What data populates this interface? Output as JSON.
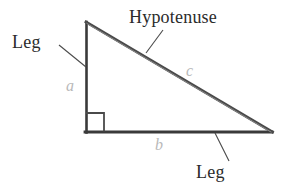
{
  "figure": {
    "background_color": "#ffffff",
    "stroke_color": "#3a3a3a",
    "leader_color": "#4a4a4a",
    "side_label_color": "#b9b9b9",
    "text_color": "#2b2b2b"
  },
  "labels": {
    "leg_top": "Leg",
    "hypotenuse": "Hypotenuse",
    "leg_bottom": "Leg",
    "side_a": "a",
    "side_b": "b",
    "side_c": "c"
  },
  "geometry": {
    "apex": [
      86,
      22
    ],
    "right_angle_vertex": [
      86,
      132
    ],
    "far_vertex": [
      272,
      132
    ],
    "right_angle_marker": {
      "x": 86,
      "y": 113,
      "size": 18
    }
  },
  "leaders": [
    {
      "name": "leg-top-leader",
      "from": [
        59,
        45
      ],
      "to": [
        86,
        67
      ]
    },
    {
      "name": "hypotenuse-leader",
      "from": [
        163,
        30
      ],
      "to": [
        146,
        53
      ]
    },
    {
      "name": "leg-bottom-leader",
      "from": [
        215,
        133
      ],
      "to": [
        229,
        161
      ]
    }
  ]
}
